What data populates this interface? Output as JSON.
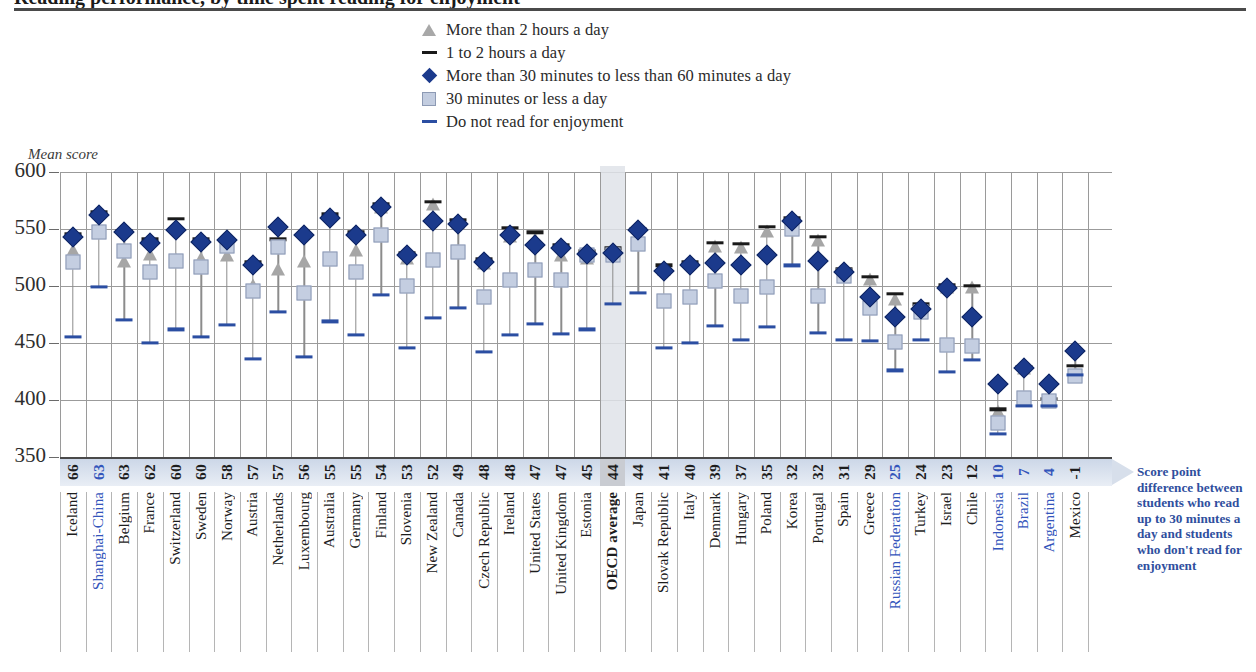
{
  "title": "Reading performance, by time spent reading for enjoyment",
  "axis": {
    "ylabel": "Mean score",
    "yticks": [
      "600",
      "550",
      "500",
      "450",
      "400",
      "350"
    ]
  },
  "legend": [
    {
      "marker": "triangle-icon",
      "label": "More than 2 hours a day"
    },
    {
      "marker": "dash-dark-icon",
      "label": "1 to 2 hours a day"
    },
    {
      "marker": "diamond-icon",
      "label": "More than 30 minutes to less than 60 minutes a day"
    },
    {
      "marker": "square-icon",
      "label": "30 minutes or less a day"
    },
    {
      "marker": "dash-blue-icon",
      "label": "Do not read for enjoyment"
    }
  ],
  "annotation": "Score point difference between students who read up to  30 minutes a day and students who don't read for enjoyment",
  "colors": {
    "diamond": "#1b3a8c",
    "square": "#c4cee1",
    "triangle": "#a6a6a6",
    "dash_dark": "#1a1a1a",
    "dash_blue": "#2b4ea2",
    "partner_text": "#3355bb",
    "band": "#ccd7e8",
    "oecd_band": "#c9ccd2"
  },
  "chart_data": {
    "type": "scatter",
    "title": "Reading performance, by time spent reading for enjoyment",
    "xlabel": "",
    "ylabel": "Mean score",
    "ylim": [
      350,
      600
    ],
    "grid": true,
    "legend_position": "top-center",
    "categories": [
      "Iceland",
      "Shanghai-China",
      "Belgium",
      "France",
      "Switzerland",
      "Sweden",
      "Norway",
      "Austria",
      "Netherlands",
      "Luxembourg",
      "Australia",
      "Germany",
      "Finland",
      "Slovenia",
      "New Zealand",
      "Canada",
      "Czech Republic",
      "Ireland",
      "United States",
      "United Kingdom",
      "Estonia",
      "OECD average",
      "Japan",
      "Slovak Republic",
      "Italy",
      "Denmark",
      "Hungary",
      "Poland",
      "Korea",
      "Portugal",
      "Spain",
      "Greece",
      "Russian Federation",
      "Turkey",
      "Israel",
      "Chile",
      "Indonesia",
      "Brazil",
      "Argentina",
      "Mexico"
    ],
    "partner_economies": [
      "Shanghai-China",
      "Russian Federation",
      "Indonesia",
      "Brazil",
      "Argentina"
    ],
    "highlight_category": "OECD average",
    "score_point_difference": [
      66,
      63,
      63,
      62,
      60,
      60,
      58,
      57,
      57,
      56,
      55,
      55,
      54,
      53,
      52,
      49,
      48,
      48,
      47,
      47,
      45,
      44,
      44,
      41,
      40,
      39,
      37,
      35,
      32,
      32,
      31,
      29,
      25,
      24,
      23,
      12,
      10,
      7,
      4,
      -1
    ],
    "series": [
      {
        "name": "More than 2 hours a day",
        "marker": "triangle",
        "values": [
          532,
          547,
          522,
          528,
          524,
          525,
          527,
          501,
          515,
          522,
          562,
          532,
          569,
          525,
          572,
          556,
          520,
          544,
          541,
          527,
          525,
          531,
          538,
          515,
          521,
          535,
          534,
          548,
          556,
          540,
          512,
          506,
          489,
          478,
          499,
          499,
          390,
          428,
          400,
          424
        ]
      },
      {
        "name": "1 to 2 hours a day",
        "marker": "dash-dark",
        "values": [
          546,
          565,
          548,
          541,
          559,
          541,
          540,
          521,
          541,
          545,
          563,
          547,
          572,
          529,
          574,
          558,
          524,
          551,
          547,
          536,
          531,
          533,
          550,
          518,
          521,
          538,
          537,
          552,
          560,
          543,
          515,
          508,
          493,
          484,
          501,
          500,
          392,
          429,
          401,
          430
        ]
      },
      {
        "name": "More than 30 minutes to less than 60 minutes a day",
        "marker": "diamond",
        "values": [
          543,
          562,
          547,
          538,
          549,
          539,
          540,
          518,
          552,
          545,
          560,
          545,
          569,
          527,
          557,
          554,
          521,
          545,
          536,
          533,
          528,
          529,
          549,
          513,
          518,
          520,
          518,
          527,
          557,
          522,
          512,
          490,
          473,
          480,
          498,
          473,
          414,
          428,
          414,
          443
        ]
      },
      {
        "name": "30 minutes or less a day",
        "marker": "square",
        "values": [
          521,
          547,
          531,
          512,
          522,
          517,
          535,
          496,
          534,
          494,
          524,
          512,
          545,
          500,
          523,
          530,
          490,
          505,
          514,
          505,
          527,
          527,
          537,
          487,
          490,
          504,
          491,
          499,
          550,
          491,
          509,
          481,
          451,
          477,
          448,
          447,
          380,
          402,
          399,
          421
        ]
      },
      {
        "name": "Do not read for enjoyment",
        "marker": "dash-blue",
        "values": [
          455,
          499,
          470,
          450,
          462,
          455,
          466,
          436,
          477,
          438,
          469,
          457,
          492,
          446,
          472,
          481,
          442,
          457,
          467,
          458,
          462,
          484,
          494,
          446,
          450,
          465,
          453,
          464,
          518,
          459,
          453,
          452,
          426,
          453,
          425,
          435,
          370,
          395,
          395,
          422
        ]
      }
    ]
  }
}
